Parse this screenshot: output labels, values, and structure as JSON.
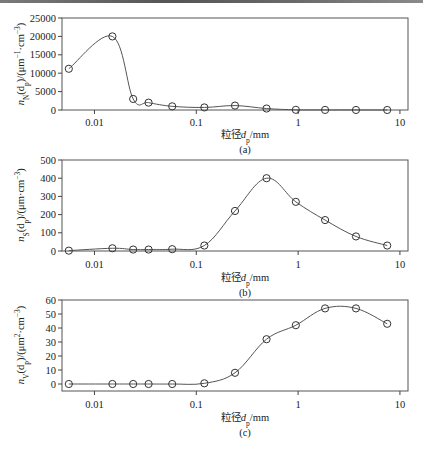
{
  "chart_data": [
    {
      "type": "line",
      "panel": "(a)",
      "title": "",
      "xlabel": "粒径d_p/mm",
      "ylabel": "n_N(d_p)/(μm^-1·cm^-3)",
      "xscale": "log",
      "xlim": [
        0.0048,
        12
      ],
      "ylim": [
        0,
        25000
      ],
      "xticks": [
        0.01,
        0.1,
        1,
        10
      ],
      "xtick_labels": [
        "0.01",
        "0.1",
        "1",
        "10"
      ],
      "yticks": [
        0,
        5000,
        10000,
        15000,
        20000,
        25000
      ],
      "ytick_labels": [
        "0",
        "5000",
        "10000",
        "15000",
        "20000",
        "25000"
      ],
      "grid": false,
      "marker": "open-circle",
      "x": [
        0.0056,
        0.015,
        0.024,
        0.034,
        0.058,
        0.12,
        0.24,
        0.49,
        0.95,
        1.84,
        3.7,
        7.5
      ],
      "values": [
        11200,
        20000,
        3000,
        2000,
        1000,
        700,
        1200,
        400,
        50,
        20,
        10,
        5
      ]
    },
    {
      "type": "line",
      "panel": "(b)",
      "title": "",
      "xlabel": "粒径d_p/mm",
      "ylabel": "n_S(d_p)/(μm·cm^-3)",
      "xscale": "log",
      "xlim": [
        0.0048,
        12
      ],
      "ylim": [
        0,
        500
      ],
      "xticks": [
        0.01,
        0.1,
        1,
        10
      ],
      "xtick_labels": [
        "0.01",
        "0.1",
        "1",
        "10"
      ],
      "yticks": [
        0,
        100,
        200,
        300,
        400,
        500
      ],
      "ytick_labels": [
        "0",
        "100",
        "200",
        "300",
        "400",
        "500"
      ],
      "grid": false,
      "marker": "open-circle",
      "x": [
        0.0056,
        0.015,
        0.024,
        0.034,
        0.058,
        0.12,
        0.24,
        0.49,
        0.95,
        1.84,
        3.7,
        7.5
      ],
      "values": [
        2,
        15,
        8,
        8,
        10,
        30,
        220,
        400,
        270,
        170,
        80,
        30
      ]
    },
    {
      "type": "line",
      "panel": "(c)",
      "title": "",
      "xlabel": "粒径d_p/mm",
      "ylabel": "n_V(d_p)/(μm^2·cm^-3)",
      "xscale": "log",
      "xlim": [
        0.0048,
        12
      ],
      "ylim": [
        -5,
        60
      ],
      "xticks": [
        0.01,
        0.1,
        1,
        10
      ],
      "xtick_labels": [
        "0.01",
        "0.1",
        "1",
        "10"
      ],
      "yticks": [
        0,
        10,
        20,
        30,
        40,
        50,
        60
      ],
      "ytick_labels": [
        "0",
        "10",
        "20",
        "30",
        "40",
        "50",
        "60"
      ],
      "grid": false,
      "marker": "open-circle",
      "x": [
        0.0056,
        0.015,
        0.024,
        0.034,
        0.058,
        0.12,
        0.24,
        0.49,
        0.95,
        1.84,
        3.7,
        7.5
      ],
      "values": [
        0,
        0,
        0,
        0,
        0,
        0.5,
        8,
        32,
        42,
        54,
        54,
        43
      ]
    }
  ],
  "labels": {
    "panel_a": "(a)",
    "panel_b": "(b)",
    "panel_c": "(c)",
    "xlabel_prefix": "粒径",
    "xlabel_var": "d",
    "xlabel_sub": "p",
    "xlabel_unit": "/mm"
  }
}
